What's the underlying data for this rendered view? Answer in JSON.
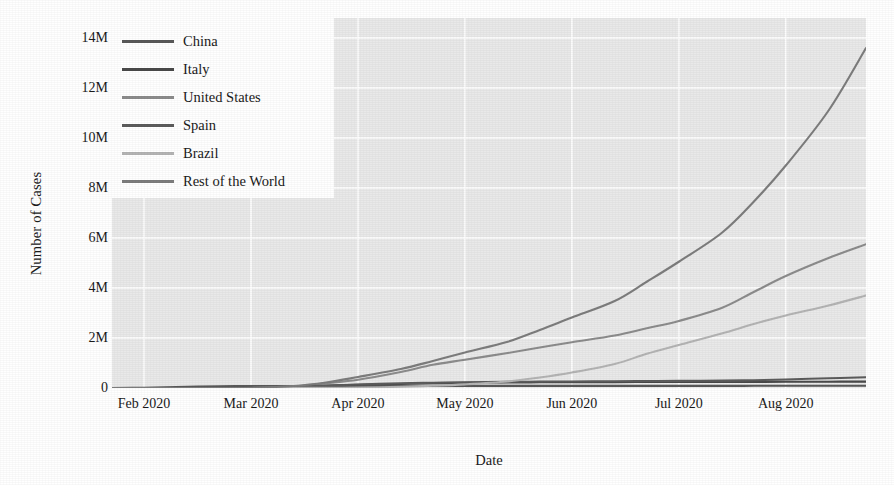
{
  "chart_data": {
    "type": "line",
    "title": "",
    "xlabel": "Date",
    "ylabel": "Number of Cases",
    "grid": true,
    "grid_color": "#ffffff",
    "plot_background": "#e9e9e9",
    "legend_position": "top-left",
    "ylim": [
      0,
      14800000
    ],
    "ytick_labels": [
      "14M",
      "12M",
      "10M",
      "8M",
      "6M",
      "4M",
      "2M",
      "0"
    ],
    "ytick_values": [
      14000000,
      12000000,
      10000000,
      8000000,
      6000000,
      4000000,
      2000000,
      0
    ],
    "xtick_labels": [
      "Feb 2020",
      "Mar 2020",
      "Apr 2020",
      "May 2020",
      "Jun 2020",
      "Jul 2020",
      "Aug 2020"
    ],
    "x_months": [
      1,
      2,
      3,
      4,
      5,
      6,
      7
    ],
    "xlim_months": [
      0.7,
      7.75
    ],
    "series": [
      {
        "name": "China",
        "color": "#595959",
        "x_months": [
          0.7,
          1.0,
          1.3,
          1.7,
          2.0,
          2.4,
          2.7,
          3.0,
          3.4,
          3.7,
          4.0,
          4.4,
          4.7,
          5.0,
          5.4,
          5.7,
          6.0,
          6.4,
          6.7,
          7.0,
          7.4,
          7.75
        ],
        "values": [
          2000,
          12000,
          40000,
          70000,
          79000,
          81000,
          82000,
          82500,
          83000,
          83500,
          84000,
          84000,
          84200,
          84500,
          85000,
          85200,
          85400,
          86000,
          87000,
          88500,
          89500,
          90000
        ]
      },
      {
        "name": "Italy",
        "color": "#4a4a4a",
        "x_months": [
          0.7,
          1.0,
          1.3,
          1.7,
          2.0,
          2.4,
          2.7,
          3.0,
          3.4,
          3.7,
          4.0,
          4.4,
          4.7,
          5.0,
          5.4,
          5.7,
          6.0,
          6.4,
          6.7,
          7.0,
          7.4,
          7.75
        ],
        "values": [
          0,
          0,
          3,
          900,
          9000,
          47000,
          92000,
          128000,
          162000,
          187000,
          206000,
          219000,
          228000,
          233000,
          236000,
          239000,
          241000,
          243000,
          245000,
          248000,
          252000,
          256000
        ]
      },
      {
        "name": "United States",
        "color": "#8c8c8c",
        "x_months": [
          0.7,
          1.0,
          1.3,
          1.7,
          2.0,
          2.4,
          2.7,
          3.0,
          3.4,
          3.7,
          4.0,
          4.4,
          4.7,
          5.0,
          5.4,
          5.7,
          6.0,
          6.4,
          6.7,
          7.0,
          7.4,
          7.75
        ],
        "values": [
          6,
          12,
          15,
          60,
          1700,
          65000,
          190000,
          330000,
          640000,
          930000,
          1130000,
          1400000,
          1620000,
          1830000,
          2100000,
          2390000,
          2680000,
          3200000,
          3840000,
          4480000,
          5200000,
          5750000
        ]
      },
      {
        "name": "Spain",
        "color": "#5c5c5c",
        "x_months": [
          0.7,
          1.0,
          1.3,
          1.7,
          2.0,
          2.4,
          2.7,
          3.0,
          3.4,
          3.7,
          4.0,
          4.4,
          4.7,
          5.0,
          5.4,
          5.7,
          6.0,
          6.4,
          6.7,
          7.0,
          7.4,
          7.75
        ],
        "values": [
          0,
          0,
          2,
          120,
          3000,
          48000,
          95000,
          140000,
          190000,
          213000,
          232000,
          245000,
          255000,
          262000,
          270000,
          277000,
          284000,
          295000,
          310000,
          340000,
          390000,
          430000
        ]
      },
      {
        "name": "Brazil",
        "color": "#b4b4b4",
        "x_months": [
          0.7,
          1.0,
          1.3,
          1.7,
          2.0,
          2.4,
          2.7,
          3.0,
          3.4,
          3.7,
          4.0,
          4.4,
          4.7,
          5.0,
          5.4,
          5.7,
          6.0,
          6.4,
          6.7,
          7.0,
          7.4,
          7.75
        ],
        "values": [
          0,
          0,
          0,
          2,
          900,
          3900,
          8000,
          16000,
          50000,
          88000,
          145000,
          260000,
          420000,
          620000,
          960000,
          1370000,
          1720000,
          2180000,
          2560000,
          2900000,
          3300000,
          3700000
        ]
      },
      {
        "name": "Rest of the World",
        "color": "#7d7d7d",
        "x_months": [
          0.7,
          1.0,
          1.3,
          1.7,
          2.0,
          2.4,
          2.7,
          3.0,
          3.4,
          3.7,
          4.0,
          4.4,
          4.7,
          5.0,
          5.4,
          5.7,
          6.0,
          6.4,
          6.7,
          7.0,
          7.4,
          7.75
        ],
        "values": [
          100,
          600,
          1200,
          2500,
          9000,
          80000,
          220000,
          440000,
          760000,
          1080000,
          1420000,
          1850000,
          2320000,
          2820000,
          3480000,
          4250000,
          5050000,
          6200000,
          7450000,
          8900000,
          11100000,
          13600000
        ]
      }
    ]
  },
  "axis": {
    "ylabel": "Number of Cases",
    "xlabel": "Date"
  },
  "legend": {
    "items": [
      {
        "label": "China",
        "color": "#595959"
      },
      {
        "label": "Italy",
        "color": "#4a4a4a"
      },
      {
        "label": "United States",
        "color": "#8c8c8c"
      },
      {
        "label": "Spain",
        "color": "#5c5c5c"
      },
      {
        "label": "Brazil",
        "color": "#b4b4b4"
      },
      {
        "label": "Rest of the World",
        "color": "#7d7d7d"
      }
    ]
  }
}
